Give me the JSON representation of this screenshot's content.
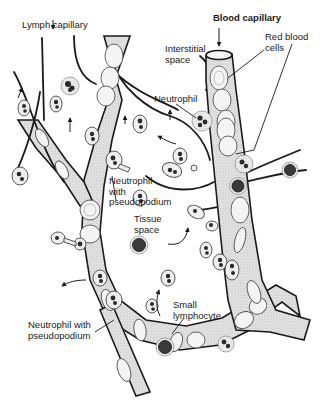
{
  "figure": {
    "type": "anatomical diagram"
  },
  "labels": {
    "lymph_capillary": "Lymph capillary",
    "blood_capillary": "Blood capillary",
    "interstitial_space": "Interstitial\nspace",
    "red_blood_cells": "Red blood\ncells",
    "neutrophil": "Neutrophil",
    "neutrophil_with_pseudopodium_center": "Neutrophil\nwith\npseudopodium",
    "tissue_space": "Tissue\nspace",
    "small_lymphocyte": "Small\nlymphocyte",
    "neutrophil_with_pseudopodium_lower": "Neutrophil with\npseudopodium"
  },
  "colors": {
    "ink": "#1a1a1a",
    "background": "#ffffff",
    "stipple": "#cfcfcf"
  }
}
